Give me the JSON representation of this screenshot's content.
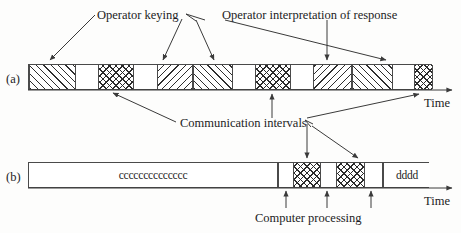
{
  "figure": {
    "background_color": "#fdfdfc",
    "line_color": "#3a3a3a"
  },
  "annotations": {
    "operator_keying": "Operator keying",
    "operator_interpretation": "Operator interpretation of response",
    "communication_intervals": "Communication intervals",
    "computer_processing": "Computer processing"
  },
  "rows": {
    "a": {
      "tag": "(a)",
      "time_axis_label": "Time",
      "segments": [
        {
          "name": "operator-keying-1",
          "kind": "hatch-right",
          "x": 28,
          "width": 47
        },
        {
          "name": "gap-1",
          "kind": "white",
          "x": 75,
          "width": 22
        },
        {
          "name": "communication-interval-1",
          "kind": "cross",
          "x": 97,
          "width": 36
        },
        {
          "name": "gap-2",
          "kind": "white",
          "x": 133,
          "width": 23
        },
        {
          "name": "operator-keying-2",
          "kind": "hatch-left",
          "x": 156,
          "width": 36
        },
        {
          "name": "operator-interpretation-1",
          "kind": "hatch-right",
          "x": 192,
          "width": 40
        },
        {
          "name": "gap-3",
          "kind": "white",
          "x": 232,
          "width": 22
        },
        {
          "name": "communication-interval-2",
          "kind": "cross",
          "x": 254,
          "width": 36
        },
        {
          "name": "gap-4",
          "kind": "white",
          "x": 290,
          "width": 22
        },
        {
          "name": "operator-keying-3",
          "kind": "hatch-left",
          "x": 312,
          "width": 39
        },
        {
          "name": "operator-interpretation-2",
          "kind": "hatch-right",
          "x": 351,
          "width": 41
        },
        {
          "name": "gap-5",
          "kind": "white",
          "x": 392,
          "width": 21
        },
        {
          "name": "communication-interval-3",
          "kind": "cross",
          "x": 413,
          "width": 19
        }
      ]
    },
    "b": {
      "tag": "(b)",
      "time_axis_label": "Time",
      "segments": [
        {
          "name": "idle-interval-c",
          "kind": "white",
          "x": 28,
          "width": 249,
          "text": "cccccccccccccc"
        },
        {
          "name": "gap-b-1",
          "kind": "white",
          "x": 277,
          "width": 15
        },
        {
          "name": "computer-processing-1",
          "kind": "cross",
          "x": 292,
          "width": 28
        },
        {
          "name": "gap-b-2",
          "kind": "white",
          "x": 320,
          "width": 15
        },
        {
          "name": "computer-processing-2",
          "kind": "cross",
          "x": 335,
          "width": 29
        },
        {
          "name": "gap-b-3",
          "kind": "white",
          "x": 364,
          "width": 18
        },
        {
          "name": "idle-interval-d",
          "kind": "white",
          "x": 382,
          "width": 47,
          "text": "dddd"
        }
      ]
    }
  }
}
